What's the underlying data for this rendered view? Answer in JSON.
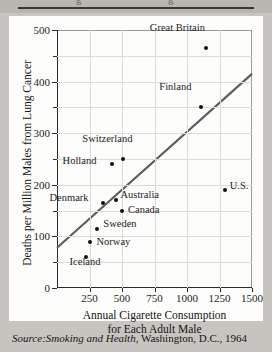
{
  "page": {
    "top_fragment_ghost_text": "g                              g",
    "source_prefix": "Source:",
    "source_title": "Smoking and Health",
    "source_rest": ", Washington, D.C., 1964"
  },
  "chart_data": {
    "type": "scatter",
    "title": "",
    "xlabel": "Annual Cigarette Consumption for Each Adult Male",
    "xlabel_line1": "Annual Cigarette Consumption",
    "xlabel_line2": "for Each Adult Male",
    "ylabel": "Deaths per Million Males from Lung Cancer",
    "xlim": [
      0,
      1500
    ],
    "ylim": [
      0,
      500
    ],
    "xticks": [
      0,
      250,
      500,
      750,
      1000,
      1250,
      1500
    ],
    "xtick_labels": [
      "",
      "250",
      "500",
      "750",
      "1000",
      "1250",
      "1500"
    ],
    "yticks": [
      0,
      100,
      200,
      300,
      400,
      500
    ],
    "ytick_labels": [
      "0",
      "100",
      "200",
      "300",
      "400",
      "500"
    ],
    "y_minor_ticks": [
      50,
      150,
      250,
      350,
      450
    ],
    "x_gridlines": [
      250,
      500,
      750,
      1000,
      1250
    ],
    "y_gridlines": [
      50,
      100,
      150,
      200,
      250,
      300,
      350,
      400,
      450
    ],
    "grid": true,
    "legend": "none",
    "points": [
      {
        "label": "Great Britain",
        "x": 1145,
        "y": 465,
        "label_dx": -56,
        "label_dy": -14
      },
      {
        "label": "Finland",
        "x": 1110,
        "y": 350,
        "label_dx": -42,
        "label_dy": -14
      },
      {
        "label": "U.S.",
        "x": 1290,
        "y": 190,
        "label_dx": 5,
        "label_dy": 2
      },
      {
        "label": "Switzerland",
        "x": 510,
        "y": 250,
        "label_dx": -41,
        "label_dy": -14
      },
      {
        "label": "Holland",
        "x": 420,
        "y": 240,
        "label_dx": -49,
        "label_dy": 3
      },
      {
        "label": "Denmark",
        "x": 350,
        "y": 165,
        "label_dx": -53,
        "label_dy": 1
      },
      {
        "label": "Australia",
        "x": 450,
        "y": 170,
        "label_dx": 5,
        "label_dy": 1
      },
      {
        "label": "Canada",
        "x": 500,
        "y": 150,
        "label_dx": 6,
        "label_dy": 5
      },
      {
        "label": "Sweden",
        "x": 310,
        "y": 115,
        "label_dx": 6,
        "label_dy": 1
      },
      {
        "label": "Norway",
        "x": 250,
        "y": 90,
        "label_dx": 7,
        "label_dy": 6
      },
      {
        "label": "Iceland",
        "x": 220,
        "y": 60,
        "label_dx": -16,
        "label_dy": 11
      }
    ],
    "trendline": {
      "name": "regression-line",
      "x0": 0,
      "y0": 78,
      "x1": 1500,
      "y1": 415,
      "color": "#5c5c5c"
    },
    "colors": {
      "point": "#111111",
      "grid": "#dbdbd8",
      "axis": "#2a2a28",
      "background": "#fdfdfb"
    }
  }
}
